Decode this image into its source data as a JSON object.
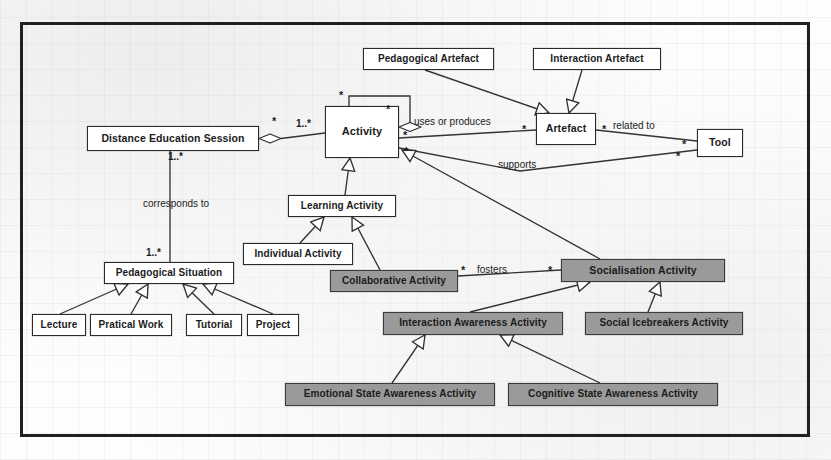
{
  "diagram": {
    "type": "uml-class-diagram",
    "colors": {
      "frame": "#231f20",
      "node_border": "#2b2b2b",
      "node_fill": "#ffffff",
      "shaded_fill": "#9a9a9a",
      "line": "#333333",
      "paper": "#fdfdfc"
    },
    "nodes": [
      {
        "id": "distance_education_session",
        "label": "Distance Education Session",
        "shaded": false,
        "x": 87,
        "y": 126,
        "w": 172,
        "h": 25,
        "font": 10.5
      },
      {
        "id": "activity",
        "label": "Activity",
        "shaded": false,
        "x": 325,
        "y": 106,
        "w": 74,
        "h": 52,
        "font": 11
      },
      {
        "id": "pedagogical_artefact",
        "label": "Pedagogical Artefact",
        "shaded": false,
        "x": 363,
        "y": 48,
        "w": 131,
        "h": 22,
        "font": 10
      },
      {
        "id": "interaction_artefact",
        "label": "Interaction Artefact",
        "shaded": false,
        "x": 533,
        "y": 48,
        "w": 128,
        "h": 22,
        "font": 10
      },
      {
        "id": "artefact",
        "label": "Artefact",
        "shaded": false,
        "x": 536,
        "y": 113,
        "w": 60,
        "h": 32,
        "font": 10.5
      },
      {
        "id": "tool",
        "label": "Tool",
        "shaded": false,
        "x": 697,
        "y": 129,
        "w": 46,
        "h": 28,
        "font": 10.5
      },
      {
        "id": "learning_activity",
        "label": "Learning Activity",
        "shaded": false,
        "x": 288,
        "y": 195,
        "w": 108,
        "h": 22,
        "font": 10
      },
      {
        "id": "individual_activity",
        "label": "Individual Activity",
        "shaded": false,
        "x": 243,
        "y": 243,
        "w": 110,
        "h": 22,
        "font": 10
      },
      {
        "id": "collaborative_activity",
        "label": "Collaborative Activity",
        "shaded": true,
        "x": 330,
        "y": 270,
        "w": 128,
        "h": 22,
        "font": 10
      },
      {
        "id": "socialisation_activity",
        "label": "Socialisation Activity",
        "shaded": true,
        "x": 561,
        "y": 259,
        "w": 164,
        "h": 23,
        "font": 10.5
      },
      {
        "id": "interaction_awareness",
        "label": "Interaction Awareness Activity",
        "shaded": true,
        "x": 383,
        "y": 312,
        "w": 180,
        "h": 23,
        "font": 10
      },
      {
        "id": "social_icebreakers",
        "label": "Social Icebreakers Activity",
        "shaded": true,
        "x": 585,
        "y": 312,
        "w": 158,
        "h": 23,
        "font": 10
      },
      {
        "id": "emotional_state",
        "label": "Emotional State Awareness Activity",
        "shaded": true,
        "x": 285,
        "y": 383,
        "w": 210,
        "h": 23,
        "font": 10
      },
      {
        "id": "cognitive_state",
        "label": "Cognitive State Awareness Activity",
        "shaded": true,
        "x": 508,
        "y": 383,
        "w": 210,
        "h": 23,
        "font": 10
      },
      {
        "id": "pedagogical_situation",
        "label": "Pedagogical Situation",
        "shaded": false,
        "x": 104,
        "y": 262,
        "w": 130,
        "h": 22,
        "font": 10
      },
      {
        "id": "lecture",
        "label": "Lecture",
        "shaded": false,
        "x": 32,
        "y": 314,
        "w": 54,
        "h": 22,
        "font": 10
      },
      {
        "id": "pratical_work",
        "label": "Pratical Work",
        "shaded": false,
        "x": 90,
        "y": 314,
        "w": 82,
        "h": 22,
        "font": 10
      },
      {
        "id": "tutorial",
        "label": "Tutorial",
        "shaded": false,
        "x": 186,
        "y": 314,
        "w": 56,
        "h": 22,
        "font": 10
      },
      {
        "id": "project",
        "label": "Project",
        "shaded": false,
        "x": 247,
        "y": 314,
        "w": 52,
        "h": 22,
        "font": 10
      }
    ],
    "edge_labels": [
      {
        "id": "uses_or_produces",
        "text": "uses or produces",
        "x": 414,
        "y": 117,
        "font": 10
      },
      {
        "id": "related_to",
        "text": "related to",
        "x": 613,
        "y": 121,
        "font": 10
      },
      {
        "id": "supports",
        "text": "supports",
        "x": 498,
        "y": 160,
        "font": 10
      },
      {
        "id": "fosters",
        "text": "fosters",
        "x": 477,
        "y": 265,
        "font": 10
      },
      {
        "id": "corresponds_to",
        "text": "corresponds to",
        "x": 143,
        "y": 199,
        "font": 10
      }
    ],
    "multiplicities": [
      {
        "id": "mult-des-activity-left",
        "text": "*",
        "x": 272,
        "y": 116,
        "font": 11
      },
      {
        "id": "mult-des-activity-right",
        "text": "1..*",
        "x": 296,
        "y": 119,
        "font": 10
      },
      {
        "id": "mult-activity-self-top",
        "text": "*",
        "x": 339,
        "y": 90,
        "font": 11
      },
      {
        "id": "mult-activity-self-right",
        "text": "*",
        "x": 386,
        "y": 104,
        "font": 11
      },
      {
        "id": "mult-activity-uses",
        "text": "*",
        "x": 403,
        "y": 130,
        "font": 11
      },
      {
        "id": "mult-artefact-uses",
        "text": "*",
        "x": 522,
        "y": 124,
        "font": 11
      },
      {
        "id": "mult-artefact-related",
        "text": "*",
        "x": 602,
        "y": 124,
        "font": 11
      },
      {
        "id": "mult-tool-related",
        "text": "*",
        "x": 682,
        "y": 139,
        "font": 11
      },
      {
        "id": "mult-activity-supports",
        "text": "*",
        "x": 404,
        "y": 146,
        "font": 11
      },
      {
        "id": "mult-tool-supports",
        "text": "*",
        "x": 676,
        "y": 151,
        "font": 11
      },
      {
        "id": "mult-des-ped-top",
        "text": "1..*",
        "x": 168,
        "y": 152,
        "font": 10
      },
      {
        "id": "mult-des-ped-bottom",
        "text": "1..*",
        "x": 146,
        "y": 248,
        "font": 10
      },
      {
        "id": "mult-collab-fosters",
        "text": "*",
        "x": 461,
        "y": 265,
        "font": 11
      },
      {
        "id": "mult-social-fosters",
        "text": "*",
        "x": 548,
        "y": 265,
        "font": 11
      }
    ]
  }
}
